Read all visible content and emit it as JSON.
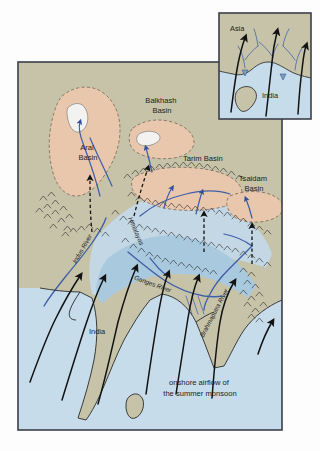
{
  "figure": {
    "kind": "physical-geography-map"
  },
  "colors": {
    "page_background": "#fdfdfd",
    "land": "#c6c3a9",
    "ocean": "#c6dcea",
    "basin_fill": "#e9c7ad",
    "plateau": "#c3d7e4",
    "lowland_blue": "#a9c9de",
    "lake_white": "#f2f3f0",
    "river_blue": "#3f5fa8",
    "coast_line": "#2a2a2a",
    "frame": "#3b3f4a",
    "arrow": "#121212",
    "text": "#1c1c1c"
  },
  "frame": {
    "main_map": {
      "x": 18,
      "y": 62,
      "width": 264,
      "height": 368
    },
    "inset_map": {
      "x": 219,
      "y": 13,
      "width": 92,
      "height": 106
    }
  },
  "inset": {
    "labels": [
      {
        "text": "Asia",
        "x": 232,
        "y": 28
      },
      {
        "text": "India",
        "x": 266,
        "y": 95
      }
    ],
    "note": "small schematic: black monsoon arrows crossing the coast from the ocean into the continent"
  },
  "basins": [
    {
      "name": "Aral Basin",
      "label_lines": [
        "Aral",
        "Basin"
      ],
      "label_x": 78,
      "label_y": 150
    },
    {
      "name": "Balkhash Basin",
      "label_lines": [
        "Balkhash",
        "Basin"
      ],
      "label_x": 162,
      "label_y": 100
    },
    {
      "name": "Tarim Basin",
      "label_lines": [
        "Tarim Basin"
      ],
      "label_x": 183,
      "label_y": 158
    },
    {
      "name": "Tsaidam Basin",
      "label_lines": [
        "Tsaidam",
        "Basin"
      ],
      "label_x": 245,
      "label_y": 178
    }
  ],
  "rivers": [
    {
      "name": "Indus River",
      "label": "Indus River",
      "x": 84,
      "y": 248,
      "rotate": -62
    },
    {
      "name": "Ganges River",
      "label": "Ganges River",
      "x": 148,
      "y": 283,
      "rotate": 22
    },
    {
      "name": "Brahmaputra River",
      "label": "Brahmaputra River",
      "x": 214,
      "y": 320,
      "rotate": -62
    }
  ],
  "ranges": [
    {
      "name": "Himalayas",
      "label": "Himalayas",
      "x": 134,
      "y": 224,
      "rotate": 68
    }
  ],
  "regions": [
    {
      "name": "India",
      "label": "India",
      "x": 97,
      "y": 332
    }
  ],
  "caption": {
    "lines": [
      "onshore airflow of",
      "the summer monsoon"
    ],
    "x": 200,
    "y": 383
  },
  "legend_semantics": {
    "solid_black_arrows": "onshore airflow of the summer monsoon",
    "dashed_black_arrows": "moisture penetrating into the interior basins",
    "blue_lines": "rivers draining the mountains",
    "chevron_hatching": "mountain ranges"
  }
}
